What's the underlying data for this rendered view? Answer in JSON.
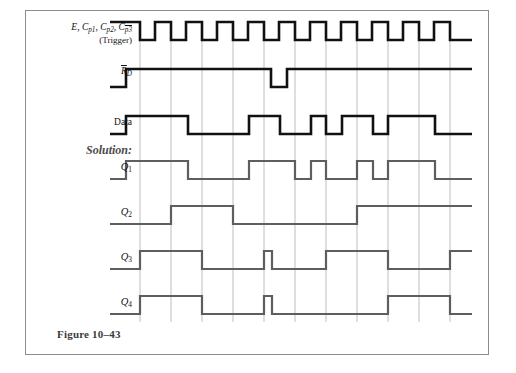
{
  "figure": {
    "caption": "Figure 10–43"
  },
  "colors": {
    "signal_black": "#111111",
    "signal_gray": "#5e5e5e",
    "grid": "#b7b7b7",
    "frame": "#8d8d8d",
    "background": "#ffffff",
    "solution_label": "#4a4a4a"
  },
  "rows": [
    {
      "id": "trigger",
      "name": "clock-trigger",
      "label_parts": {
        "lead": "E, ",
        "c1": "C",
        "c1_sub": "p1",
        "c2": "C",
        "c2_sub": "p2",
        "c3": "C",
        "c3_sub": "p3",
        "sep": ", "
      },
      "label_text": "E, Cp1, Cp2, Cp3",
      "sublabel": "(Trigger)",
      "style": "black",
      "start_level": 1
    },
    {
      "id": "rd",
      "name": "reset-not",
      "label_text": "RD",
      "base": "R",
      "sub": "D",
      "overbar": true,
      "style": "black",
      "start_level": 0
    },
    {
      "id": "data",
      "name": "data",
      "label_text": "Data",
      "style": "black",
      "start_level": 0
    },
    {
      "id": "q1",
      "name": "q1",
      "label_text": "Q1",
      "base": "Q",
      "sub": "1",
      "style": "gray",
      "start_level": 0,
      "group_label": "Solution:"
    },
    {
      "id": "q2",
      "name": "q2",
      "label_text": "Q2",
      "base": "Q",
      "sub": "2",
      "style": "gray",
      "start_level": 0
    },
    {
      "id": "q3",
      "name": "q3",
      "label_text": "Q3",
      "base": "Q",
      "sub": "3",
      "style": "gray",
      "start_level": 0
    },
    {
      "id": "q4",
      "name": "q4",
      "label_text": "Q4",
      "base": "Q",
      "sub": "4",
      "style": "gray",
      "start_level": 0
    }
  ],
  "chart_data": {
    "type": "line",
    "xlabel": "time",
    "ylabel": "logic level",
    "grid": true,
    "legend": "none",
    "x_range": [
      110,
      472
    ],
    "gridlines_x": [
      140,
      171,
      202,
      233,
      264,
      295,
      326,
      357,
      388,
      419,
      450
    ],
    "levels": {
      "low": 0,
      "high": 1
    },
    "series": [
      {
        "name": "E, Cp1, Cp2, Cp3 (Trigger)",
        "color": "#111111",
        "width": 2.6,
        "rows": "trigger",
        "transitions": [
          {
            "x": 110,
            "level": 1
          },
          {
            "x": 140,
            "level": 0
          },
          {
            "x": 155,
            "level": 1
          },
          {
            "x": 171,
            "level": 0
          },
          {
            "x": 186,
            "level": 1
          },
          {
            "x": 202,
            "level": 0
          },
          {
            "x": 217,
            "level": 1
          },
          {
            "x": 233,
            "level": 0
          },
          {
            "x": 248,
            "level": 1
          },
          {
            "x": 264,
            "level": 0
          },
          {
            "x": 279,
            "level": 1
          },
          {
            "x": 295,
            "level": 0
          },
          {
            "x": 310,
            "level": 1
          },
          {
            "x": 326,
            "level": 0
          },
          {
            "x": 341,
            "level": 1
          },
          {
            "x": 357,
            "level": 0
          },
          {
            "x": 372,
            "level": 1
          },
          {
            "x": 388,
            "level": 0
          },
          {
            "x": 403,
            "level": 1
          },
          {
            "x": 419,
            "level": 0
          },
          {
            "x": 434,
            "level": 1
          },
          {
            "x": 450,
            "level": 0
          },
          {
            "x": 472,
            "level": 0
          }
        ]
      },
      {
        "name": "RD",
        "color": "#111111",
        "width": 2.6,
        "rows": "rd",
        "transitions": [
          {
            "x": 110,
            "level": 0
          },
          {
            "x": 126,
            "level": 1
          },
          {
            "x": 271,
            "level": 0
          },
          {
            "x": 287,
            "level": 1
          },
          {
            "x": 472,
            "level": 1
          }
        ]
      },
      {
        "name": "Data",
        "color": "#111111",
        "width": 2.6,
        "rows": "data",
        "transitions": [
          {
            "x": 110,
            "level": 0
          },
          {
            "x": 126,
            "level": 1
          },
          {
            "x": 188,
            "level": 0
          },
          {
            "x": 249,
            "level": 1
          },
          {
            "x": 280,
            "level": 0
          },
          {
            "x": 311,
            "level": 1
          },
          {
            "x": 326,
            "level": 0
          },
          {
            "x": 342,
            "level": 1
          },
          {
            "x": 373,
            "level": 0
          },
          {
            "x": 388,
            "level": 1
          },
          {
            "x": 435,
            "level": 0
          },
          {
            "x": 472,
            "level": 0
          }
        ]
      },
      {
        "name": "Q1",
        "color": "#5e5e5e",
        "width": 2.2,
        "rows": "q1",
        "transitions": [
          {
            "x": 110,
            "level": 0
          },
          {
            "x": 126,
            "level": 1
          },
          {
            "x": 188,
            "level": 0
          },
          {
            "x": 249,
            "level": 1
          },
          {
            "x": 295,
            "level": 0
          },
          {
            "x": 311,
            "level": 1
          },
          {
            "x": 326,
            "level": 0
          },
          {
            "x": 357,
            "level": 1
          },
          {
            "x": 373,
            "level": 0
          },
          {
            "x": 388,
            "level": 1
          },
          {
            "x": 435,
            "level": 0
          },
          {
            "x": 472,
            "level": 0
          }
        ]
      },
      {
        "name": "Q2",
        "color": "#5e5e5e",
        "width": 2.2,
        "rows": "q2",
        "transitions": [
          {
            "x": 110,
            "level": 0
          },
          {
            "x": 171,
            "level": 1
          },
          {
            "x": 233,
            "level": 0
          },
          {
            "x": 357,
            "level": 1
          },
          {
            "x": 472,
            "level": 1
          }
        ]
      },
      {
        "name": "Q3",
        "color": "#5e5e5e",
        "width": 2.2,
        "rows": "q3",
        "transitions": [
          {
            "x": 110,
            "level": 0
          },
          {
            "x": 140,
            "level": 1
          },
          {
            "x": 202,
            "level": 0
          },
          {
            "x": 264,
            "level": 1
          },
          {
            "x": 272,
            "level": 0
          },
          {
            "x": 326,
            "level": 1
          },
          {
            "x": 388,
            "level": 0
          },
          {
            "x": 450,
            "level": 1
          },
          {
            "x": 472,
            "level": 1
          }
        ]
      },
      {
        "name": "Q4",
        "color": "#5e5e5e",
        "width": 2.2,
        "rows": "q4",
        "transitions": [
          {
            "x": 110,
            "level": 0
          },
          {
            "x": 140,
            "level": 1
          },
          {
            "x": 202,
            "level": 0
          },
          {
            "x": 264,
            "level": 1
          },
          {
            "x": 272,
            "level": 0
          },
          {
            "x": 388,
            "level": 1
          },
          {
            "x": 450,
            "level": 0
          },
          {
            "x": 472,
            "level": 0
          }
        ]
      }
    ]
  }
}
